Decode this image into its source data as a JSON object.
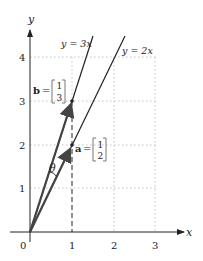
{
  "axes": {
    "x_label": "x",
    "y_label": "y",
    "x_ticks": [
      "0",
      "1",
      "2",
      "3"
    ],
    "y_ticks": [
      "1",
      "2",
      "3",
      "4"
    ]
  },
  "lines": [
    {
      "label": "y = 3x",
      "slope": 3
    },
    {
      "label": "y = 2x",
      "slope": 2
    }
  ],
  "vectors": {
    "a": {
      "name": "a",
      "eq": "=",
      "components": [
        "1",
        "2"
      ]
    },
    "b": {
      "name": "b",
      "eq": "=",
      "components": [
        "1",
        "3"
      ]
    }
  },
  "angle_label": "θ",
  "colors": {
    "ink": "#222222",
    "grid": "#aaaaaa",
    "vector": "#444444"
  }
}
